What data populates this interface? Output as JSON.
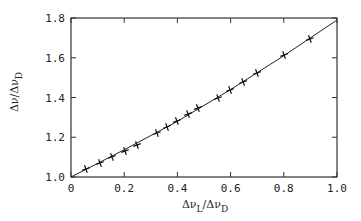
{
  "chart_data": {
    "type": "line",
    "title": "",
    "xlabel": "Δν_L/Δν_D",
    "ylabel": "Δν/Δν_D",
    "xlim": [
      0,
      1.0
    ],
    "ylim": [
      1.0,
      1.8
    ],
    "grid": false,
    "legend": null,
    "x_ticks": [
      "0",
      "0.2",
      "0.4",
      "0.6",
      "0.8",
      "1.0"
    ],
    "y_ticks": [
      "1.0",
      "1.2",
      "1.4",
      "1.6",
      "1.8"
    ],
    "series": [
      {
        "name": "data",
        "style": "plus-markers",
        "x": [
          0.056,
          0.109,
          0.154,
          0.203,
          0.248,
          0.323,
          0.361,
          0.398,
          0.44,
          0.477,
          0.553,
          0.598,
          0.647,
          0.699,
          0.801,
          0.898
        ],
        "y": [
          1.04,
          1.07,
          1.101,
          1.131,
          1.161,
          1.221,
          1.252,
          1.282,
          1.317,
          1.347,
          1.397,
          1.438,
          1.478,
          1.523,
          1.614,
          1.694
        ]
      },
      {
        "name": "fit",
        "style": "solid-line",
        "x": [
          0,
          0.2,
          0.4,
          0.6,
          0.8,
          1.0
        ],
        "y": [
          1.0,
          1.137,
          1.28,
          1.44,
          1.61,
          1.79
        ]
      }
    ]
  },
  "axes": {
    "xlabel_main": "Δν",
    "xlabel_sub1": "L",
    "xlabel_mid": "/Δν",
    "xlabel_sub2": "D",
    "ylabel_main": "Δν/Δν",
    "ylabel_sub": "D"
  }
}
